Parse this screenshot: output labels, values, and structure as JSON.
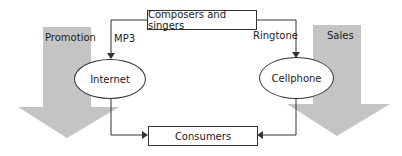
{
  "diagram": {
    "top_node": "Composers and singers",
    "bottom_node": "Consumers",
    "left_channel": "Internet",
    "right_channel": "Cellphone",
    "left_edge_label": "MP3",
    "right_edge_label": "Ringtone",
    "left_arrow_label": "Promotion",
    "right_arrow_label": "Sales",
    "colors": {
      "big_arrow_fill": "#c4c4c4",
      "line": "#333333",
      "text": "#1a1a1a"
    }
  }
}
